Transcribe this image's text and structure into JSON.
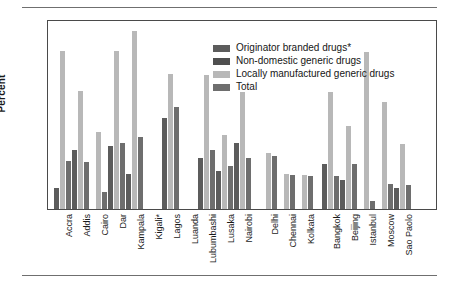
{
  "chart_data": {
    "type": "bar",
    "title": "",
    "xlabel": "",
    "ylabel": "Percent",
    "ylim": [
      0,
      20
    ],
    "yticks": [
      0,
      5,
      10,
      15,
      20
    ],
    "grid": false,
    "legend_position": "top-center-inside",
    "categories": [
      "Accra",
      "Addis",
      "Cairo",
      "Dar",
      "Kampala",
      "Kigali*",
      "Lagos",
      "Luanda",
      "Lubumbashi",
      "Lusaka",
      "Nairobi",
      "Delhi",
      "Chennai",
      "Kolkata",
      "Bangkok",
      "Beijing",
      "Istanbul",
      "Moscow",
      "Sao Paolo"
    ],
    "group_breaks_after": [
      "Nairobi",
      "Kolkata"
    ],
    "series": [
      {
        "name": "Originator branded drugs*",
        "color": "#5c5c5c",
        "values": [
          2.2,
          6.2,
          null,
          6.6,
          3.7,
          null,
          9.6,
          null,
          5.4,
          4.0,
          6.9,
          null,
          null,
          null,
          4.7,
          3.1,
          null,
          null,
          2.2
        ]
      },
      {
        "name": "Non-domestic generic drugs",
        "color": "#4f4f4f",
        "values": [
          null,
          null,
          null,
          null,
          null,
          null,
          null,
          null,
          null,
          null,
          null,
          null,
          null,
          null,
          null,
          null,
          null,
          null,
          null
        ]
      },
      {
        "name": "Locally manufactured generic drugs",
        "color": "#b8b8b8",
        "values": [
          16.6,
          12.4,
          8.1,
          16.6,
          18.7,
          null,
          14.2,
          null,
          14.1,
          7.8,
          12.3,
          5.9,
          3.7,
          3.6,
          12.3,
          8.7,
          16.5,
          11.3,
          6.8
        ]
      },
      {
        "name": "Total",
        "color": "#6e6e6e",
        "values": [
          5.1,
          4.9,
          1.8,
          7.0,
          7.6,
          null,
          10.7,
          null,
          6.2,
          4.5,
          5.4,
          5.6,
          3.6,
          3.5,
          3.5,
          4.7,
          0.8,
          2.6,
          2.5
        ]
      }
    ]
  },
  "legend": {
    "items": [
      {
        "label": "Originator branded drugs*",
        "color": "#5c5c5c"
      },
      {
        "label": "Non-domestic generic drugs",
        "color": "#4f4f4f"
      },
      {
        "label": "Locally manufactured generic drugs",
        "color": "#b8b8b8"
      },
      {
        "label": "Total",
        "color": "#6e6e6e"
      }
    ]
  },
  "axes": {
    "y_axis_title": "Percent",
    "y_tick_labels": [
      "0",
      "5",
      "10",
      "15",
      "20"
    ]
  }
}
